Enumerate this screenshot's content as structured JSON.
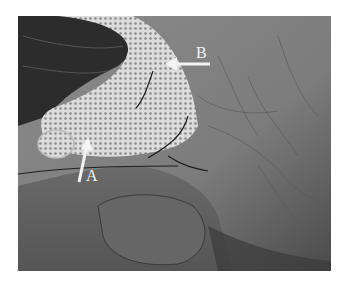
{
  "figure": {
    "labels": [
      {
        "id": "A",
        "text": "A"
      },
      {
        "id": "B",
        "text": "B"
      }
    ],
    "colors": {
      "background": "#ffffff",
      "tissue": "#7a7a7a",
      "mesh": "#d8d8d8",
      "forceps": "#2a2a2a",
      "arrow": "#f4f4f4"
    }
  }
}
